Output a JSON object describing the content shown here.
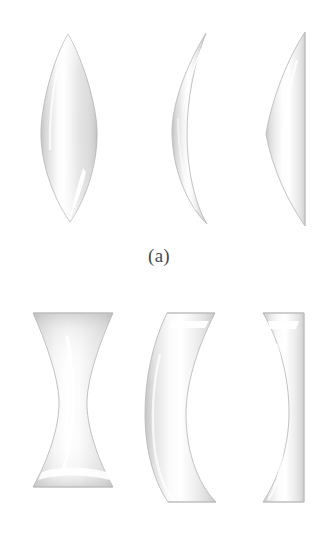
{
  "figure": {
    "background_color": "#ffffff",
    "width": 318,
    "height": 558,
    "glass_edge_color": "#c9c9c9",
    "glass_fill_light": "#fefefe",
    "glass_fill_mid": "#ededed",
    "glass_fill_dark": "#d6d6d6",
    "caption_color": "#4a4a4a"
  },
  "panels": [
    {
      "id": "a",
      "caption": "(a)",
      "description": "Converging lenses, thicker at center than at edges",
      "lenses": [
        {
          "name": "biconvex",
          "label": "biconvex lens"
        },
        {
          "name": "positive-meniscus",
          "label": "convex-concave (positive meniscus) lens"
        },
        {
          "name": "plano-convex",
          "label": "plano-convex lens"
        }
      ]
    },
    {
      "id": "b",
      "caption": "(b)",
      "description": "Diverging lenses, thinner at center than at edges",
      "lenses": [
        {
          "name": "biconcave",
          "label": "biconcave lens"
        },
        {
          "name": "negative-meniscus",
          "label": "concave-convex (negative meniscus) lens"
        },
        {
          "name": "plano-concave",
          "label": "plano-concave lens"
        }
      ]
    }
  ],
  "captions": {
    "a": "(a)",
    "b": "(b)"
  }
}
